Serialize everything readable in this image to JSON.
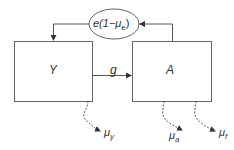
{
  "diagram": {
    "nodes": {
      "yearlings": {
        "label": "Y"
      },
      "adults": {
        "label": "A"
      },
      "reproduction": {
        "prefix": "e(1−μ",
        "sub": "e",
        "suffix": ")"
      }
    },
    "edges": {
      "growth": {
        "label": "g"
      }
    },
    "losses": {
      "mu_y": {
        "symbol": "μ",
        "sub": "y"
      },
      "mu_a": {
        "symbol": "μ",
        "sub": "a"
      },
      "mu_f": {
        "symbol": "μ",
        "sub": "f"
      }
    },
    "colors": {
      "line": "#555555",
      "text": "#333333"
    }
  }
}
